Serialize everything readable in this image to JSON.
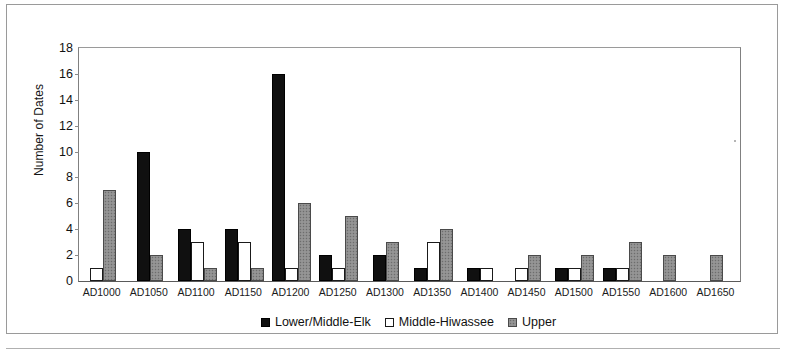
{
  "chart_data": {
    "type": "bar",
    "title": "",
    "xlabel": "",
    "ylabel": "Number of Dates",
    "ylim": [
      0,
      18
    ],
    "ytick_step": 2,
    "yticks": [
      0,
      2,
      4,
      6,
      8,
      10,
      12,
      14,
      16,
      18
    ],
    "grid": false,
    "legend_position": "bottom",
    "categories": [
      "AD1000",
      "AD1050",
      "AD1100",
      "AD1150",
      "AD1200",
      "AD1250",
      "AD1300",
      "AD1350",
      "AD1400",
      "AD1450",
      "AD1500",
      "AD1550",
      "AD1600",
      "AD1650"
    ],
    "series": [
      {
        "name": "Lower/Middle-Elk",
        "color": "#101010",
        "fill": "solid-black",
        "values": [
          0,
          10,
          4,
          4,
          16,
          2,
          2,
          1,
          1,
          0,
          1,
          1,
          0,
          0
        ]
      },
      {
        "name": "Middle-Hiwassee",
        "color": "#ffffff",
        "fill": "white-outline",
        "values": [
          1,
          0,
          3,
          3,
          1,
          1,
          0,
          3,
          1,
          1,
          1,
          1,
          0,
          0
        ]
      },
      {
        "name": "Upper",
        "color": "#8e8e8e",
        "fill": "gray-speckle",
        "values": [
          7,
          2,
          1,
          1,
          6,
          5,
          3,
          4,
          0,
          2,
          2,
          3,
          2,
          2
        ]
      }
    ]
  }
}
